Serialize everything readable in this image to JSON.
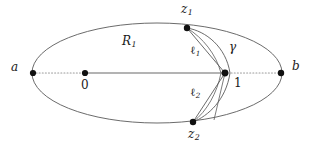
{
  "figure": {
    "type": "geometric-diagram",
    "canvas": {
      "width": 312,
      "height": 143,
      "background": "#ffffff"
    },
    "colors": {
      "stroke": "#5a5a5a",
      "axis_solid": "#9a9a9a",
      "axis_dotted": "#9a9a9a",
      "point_fill": "#111111",
      "label_text": "#1a1a1a"
    },
    "ellipse": {
      "cx": 157,
      "cy": 73,
      "rx": 125,
      "ry": 50
    },
    "points": [
      {
        "id": "a",
        "x": 33,
        "y": 73
      },
      {
        "id": "0",
        "x": 85,
        "y": 73
      },
      {
        "id": "1",
        "x": 225,
        "y": 73
      },
      {
        "id": "b",
        "x": 281,
        "y": 73
      },
      {
        "id": "z1",
        "x": 187,
        "y": 28
      },
      {
        "id": "z2",
        "x": 193,
        "y": 122
      }
    ]
  },
  "labels": {
    "a": "a",
    "b": "b",
    "zero": "0",
    "one": "1",
    "z1_base": "z",
    "z1_sub": "1",
    "z2_base": "z",
    "z2_sub": "2",
    "R1_base": "R",
    "R1_sub": "1",
    "l1_base": "ℓ",
    "l1_sub": "1",
    "l2_base": "ℓ",
    "l2_sub": "2",
    "gamma": "γ"
  }
}
